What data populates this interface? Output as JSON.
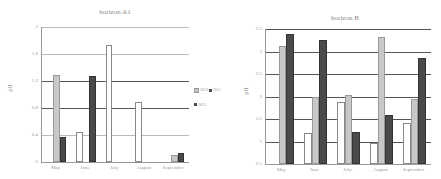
{
  "chart_data": [
    {
      "type": "bar",
      "title": "horizon A1",
      "xlabel": "",
      "ylabel": "pH",
      "categories": [
        "May",
        "June",
        "July",
        "August",
        "September"
      ],
      "yticks": [
        "0",
        "0.4",
        "0.8",
        "1.2",
        "1.6",
        "2"
      ],
      "ylim": [
        0,
        2
      ],
      "grid": true,
      "legend_position": "right",
      "series": [
        {
          "name": "2011",
          "color": "#ffffff",
          "values": [
            0,
            0.45,
            1.73,
            0.89,
            0
          ]
        },
        {
          "name": "2012",
          "color": "#c8c8c8",
          "values": [
            1.29,
            0,
            0,
            0,
            0.1
          ]
        },
        {
          "name": "2013",
          "color": "#4a4a4a",
          "values": [
            0.37,
            1.27,
            0,
            0,
            0.14
          ]
        }
      ]
    },
    {
      "type": "bar",
      "title": "horizon B",
      "xlabel": "",
      "ylabel": "pH",
      "categories": [
        "May",
        "June",
        "July",
        "August",
        "September"
      ],
      "yticks": [
        "0.5",
        "1",
        "1.5",
        "2",
        "2.5",
        "3",
        "3.5"
      ],
      "ylim": [
        0.5,
        3.5
      ],
      "grid": true,
      "series": [
        {
          "name": "2011",
          "color": "#ffffff",
          "values": [
            0,
            1.19,
            1.87,
            0.97,
            1.41
          ]
        },
        {
          "name": "2012",
          "color": "#c8c8c8",
          "values": [
            3.13,
            1.99,
            2.04,
            3.33,
            1.95
          ]
        },
        {
          "name": "2013",
          "color": "#4a4a4a",
          "values": [
            3.39,
            3.26,
            1.21,
            1.58,
            2.86
          ]
        }
      ]
    }
  ],
  "legend": {
    "items": [
      "2011",
      "2012",
      "2013"
    ]
  }
}
